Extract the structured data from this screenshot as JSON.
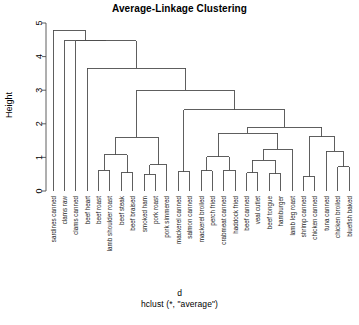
{
  "title": "Average-Linkage Clustering",
  "axis": {
    "ylabel": "Height",
    "yticks": [
      "0",
      "1",
      "2",
      "3",
      "4",
      "5"
    ],
    "xcaption_line1": "d",
    "xcaption_line2": "hclust (*, \"average\")"
  },
  "colors": {
    "line": "#4d4d4d",
    "axis": "#4d4d4d",
    "text": "#000000"
  },
  "chart_data": {
    "type": "dendrogram",
    "title": "Average-Linkage Clustering",
    "xlabel": "d",
    "ylabel": "Height",
    "ylim": [
      0,
      5
    ],
    "yticks": [
      0,
      1,
      2,
      3,
      4,
      5
    ],
    "grid": false,
    "linkage": "average",
    "leaf_count": 28,
    "leaves": [
      "sardines canned",
      "clams raw",
      "clams canned",
      "beef heart",
      "beef roast",
      "lamb shoulder roast",
      "beef steak",
      "beef braised",
      "smoked ham",
      "pork roast",
      "pork simmered",
      "mackerel canned",
      "salmon canned",
      "mackerel broiled",
      "perch fried",
      "crabmeat canned",
      "haddock fried",
      "beef canned",
      "veal cutlet",
      "beef tongue",
      "hamburger",
      "lamb leg roast",
      "shrimp canned",
      "chicken canned",
      "tuna canned",
      "chicken broiled",
      "bluefish baked"
    ],
    "merges": [
      {
        "id": "m1",
        "left": "beef roast",
        "right": "lamb shoulder roast",
        "height": 0.62
      },
      {
        "id": "m2",
        "left": "beef steak",
        "right": "beef braised",
        "height": 0.55
      },
      {
        "id": "m3",
        "left": "m1",
        "right": "m2",
        "height": 1.08
      },
      {
        "id": "m4",
        "left": "smoked ham",
        "right": "pork roast",
        "height": 0.5
      },
      {
        "id": "m5",
        "left": "m4",
        "right": "pork simmered",
        "height": 0.78
      },
      {
        "id": "m6",
        "left": "m3",
        "right": "m5",
        "height": 1.6
      },
      {
        "id": "m7",
        "left": "mackerel canned",
        "right": "salmon canned",
        "height": 0.58
      },
      {
        "id": "m8",
        "left": "mackerel broiled",
        "right": "perch fried",
        "height": 0.6
      },
      {
        "id": "m9",
        "left": "crabmeat canned",
        "right": "haddock fried",
        "height": 0.62
      },
      {
        "id": "m10",
        "left": "m8",
        "right": "m9",
        "height": 1.02
      },
      {
        "id": "m11",
        "left": "beef canned",
        "right": "veal cutlet",
        "height": 0.55
      },
      {
        "id": "m12",
        "left": "beef tongue",
        "right": "hamburger",
        "height": 0.52
      },
      {
        "id": "m13",
        "left": "m11",
        "right": "m12",
        "height": 0.92
      },
      {
        "id": "m14",
        "left": "m13",
        "right": "lamb leg roast",
        "height": 1.25
      },
      {
        "id": "m15",
        "left": "m10",
        "right": "m14",
        "height": 1.72
      },
      {
        "id": "m16",
        "left": "shrimp canned",
        "right": "chicken canned",
        "height": 0.42
      },
      {
        "id": "m17",
        "left": "chicken broiled",
        "right": "bluefish baked",
        "height": 0.72
      },
      {
        "id": "m18",
        "left": "tuna canned",
        "right": "m17",
        "height": 1.18
      },
      {
        "id": "m19",
        "left": "m16",
        "right": "m18",
        "height": 1.62
      },
      {
        "id": "m20",
        "left": "m15",
        "right": "m19",
        "height": 1.9
      },
      {
        "id": "m21",
        "left": "m7",
        "right": "m20",
        "height": 2.42
      },
      {
        "id": "m22",
        "left": "m6",
        "right": "m21",
        "height": 3.0
      },
      {
        "id": "m23",
        "left": "beef heart",
        "right": "m22",
        "height": 3.65
      },
      {
        "id": "m24",
        "left": "clams canned",
        "right": "m23",
        "height": 4.47
      },
      {
        "id": "m25",
        "left": "clams raw",
        "right": "m24",
        "height": 4.47
      },
      {
        "id": "m26",
        "left": "sardines canned",
        "right": "m25",
        "height": 4.78
      }
    ]
  }
}
